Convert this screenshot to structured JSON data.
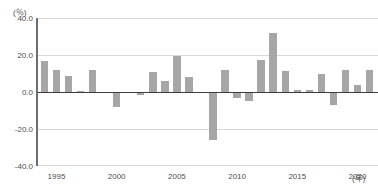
{
  "chart_data": {
    "type": "bar",
    "title": "",
    "subtitle": "",
    "xlabel": "年",
    "ylabel": "",
    "unit_label": "(％)",
    "ylim": [
      -40.0,
      40.0
    ],
    "xlim": [
      1993.3,
      2021.7
    ],
    "grid": true,
    "legend": null,
    "bar_color": "#a6a6a6",
    "axis_color": "#6e6e6e",
    "zero_line_color": "#3d3d3d",
    "grid_color": "#d9d9d9",
    "y_ticks": [
      "40.0",
      "20.0",
      "0.0",
      "-20.0",
      "-40.0"
    ],
    "y_tick_values": [
      40.0,
      20.0,
      0.0,
      -20.0,
      -40.0
    ],
    "x_ticks": [
      "1995",
      "2000",
      "2005",
      "2010",
      "2015",
      "2020"
    ],
    "x_tick_values": [
      1995,
      2000,
      2005,
      2010,
      2015,
      2020
    ],
    "x_unit_suffix": "(年)",
    "categories": [
      1994,
      1995,
      1996,
      1997,
      1998,
      1999,
      2000,
      2001,
      2002,
      2003,
      2004,
      2005,
      2006,
      2007,
      2008,
      2009,
      2010,
      2011,
      2012,
      2013,
      2014,
      2015,
      2016,
      2017,
      2018,
      2019,
      2020,
      2021
    ],
    "values": [
      17.0,
      12.0,
      8.5,
      0.6,
      12.0,
      0.0,
      -8.0,
      0.0,
      -1.5,
      11.0,
      6.0,
      19.5,
      8.0,
      0.0,
      -26.0,
      12.0,
      -3.0,
      -5.0,
      17.5,
      32.0,
      11.5,
      1.0,
      1.0,
      9.5,
      -7.0,
      12.0,
      4.0,
      12.0
    ]
  }
}
